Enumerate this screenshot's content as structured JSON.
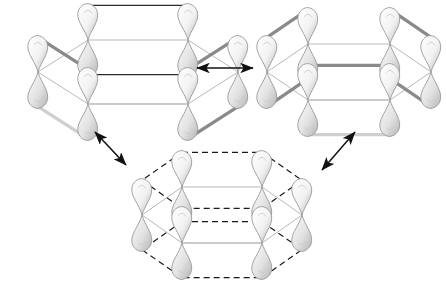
{
  "figure": {
    "background_color": "#ffffff",
    "width": 446,
    "height": 283
  },
  "palette": {
    "ring_line": "#b9b9b9",
    "ring_line_dashed": "#1a1a1a",
    "bond_dark": "#2b2b2b",
    "bond_gray": "#8a8a8a",
    "bond_light": "#cfcfcf",
    "orbital_outline": "#9a9a9a",
    "orbital_fill_top": "#f2f2f2",
    "orbital_fill_bottom": "#e2e2e2",
    "arrow_color": "#111111"
  },
  "structures": [
    {
      "id": "kekule-left",
      "name": "kekule-structure-left",
      "label": "",
      "ring_style": "solid",
      "center_x": 138,
      "center_y": 72,
      "rx": 100,
      "ry": 32,
      "orbital_count": 6,
      "lobe_height": 34,
      "bond_pairs": [
        [
          0,
          1
        ],
        [
          2,
          3
        ],
        [
          4,
          5
        ]
      ],
      "top_bond_indices": [
        0,
        2,
        4
      ],
      "bottom_bond_indices": [
        1,
        3,
        5
      ]
    },
    {
      "id": "kekule-right",
      "name": "kekule-structure-right",
      "label": "",
      "ring_style": "solid",
      "center_x": 349,
      "center_y": 72,
      "rx": 82,
      "ry": 28,
      "orbital_count": 6,
      "lobe_height": 34,
      "bond_pairs": [
        [
          1,
          2
        ],
        [
          3,
          4
        ],
        [
          5,
          0
        ]
      ],
      "top_bond_indices": [
        1,
        3,
        5
      ],
      "bottom_bond_indices": [
        2,
        4,
        0
      ]
    },
    {
      "id": "delocalized-bottom",
      "name": "delocalized-structure-bottom",
      "label": "",
      "ring_style": "dashed",
      "center_x": 222,
      "center_y": 215,
      "rx": 80,
      "ry": 28,
      "orbital_count": 6,
      "lobe_height": 34,
      "bond_pairs": [],
      "top_bond_indices": [],
      "bottom_bond_indices": []
    }
  ],
  "arrows": [
    {
      "id": "arrow-horizontal",
      "name": "resonance-arrow-horizontal",
      "x1": 197,
      "y1": 68,
      "x2": 253,
      "y2": 68,
      "double_headed": true
    },
    {
      "id": "arrow-left-diagonal",
      "name": "resonance-arrow-left-diagonal",
      "x1": 95,
      "y1": 132,
      "x2": 126,
      "y2": 165,
      "double_headed": true
    },
    {
      "id": "arrow-right-diagonal",
      "name": "resonance-arrow-right-diagonal",
      "x1": 355,
      "y1": 132,
      "x2": 322,
      "y2": 170,
      "double_headed": true
    }
  ],
  "annotations": {
    "caption": "",
    "notes": ""
  }
}
